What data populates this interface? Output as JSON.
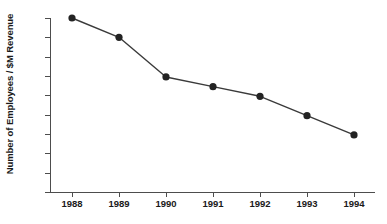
{
  "chart_data": {
    "type": "line",
    "title": "",
    "xlabel": "",
    "ylabel": "Number of Employees / $M Revenue",
    "categories": [
      "1988",
      "1989",
      "1990",
      "1991",
      "1992",
      "1993",
      "1994"
    ],
    "values": [
      5.8,
      5.6,
      5.19,
      5.09,
      4.99,
      4.79,
      4.59
    ],
    "series": [
      {
        "name": "Employees per $M Revenue",
        "values": [
          5.8,
          5.6,
          5.19,
          5.09,
          4.99,
          4.79,
          4.59
        ]
      }
    ],
    "ylim": [
      4,
      5.8
    ],
    "ytick_labels": [
      "4",
      "4.2",
      "4.4",
      "4.6",
      "4.8",
      "5",
      "5.2",
      "5.4",
      "5.6",
      "5.8"
    ],
    "ytick_values": [
      4,
      4.2,
      4.4,
      4.6,
      4.8,
      5,
      5.2,
      5.4,
      5.6,
      5.8
    ],
    "xtick_labels": [
      "1988",
      "1989",
      "1990",
      "1991",
      "1992",
      "1993",
      "1994"
    ],
    "grid": false,
    "legend": "none",
    "line_color": "#3a3a3a",
    "marker_color": "#232323",
    "axis_color": "#4d4d4d",
    "background_color": "#ffffff"
  }
}
